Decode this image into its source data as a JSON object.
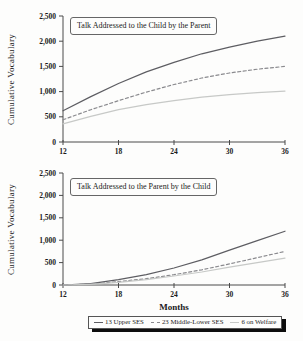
{
  "colors": {
    "background": "#fdfdfc",
    "axis": "#4a4a4a",
    "text": "#1b1b1b",
    "line_upper_ses": "#5d5d62",
    "line_middle_lower_ses": "#8a8a8e",
    "line_welfare": "#c7c9c7",
    "legend_shadow": "#0d0d0d"
  },
  "chart_data": [
    {
      "type": "line",
      "title": "Talk Addressed to the Child by the Parent",
      "ylabel": "Cumulative Vocabulary",
      "xlabel": "",
      "xlim": [
        12,
        36
      ],
      "ylim": [
        0,
        2500
      ],
      "grid": false,
      "x": [
        12,
        15,
        18,
        21,
        24,
        27,
        30,
        33,
        36
      ],
      "xticks": [
        {
          "value": 12,
          "label": "12"
        },
        {
          "value": 18,
          "label": "18"
        },
        {
          "value": 24,
          "label": "24"
        },
        {
          "value": 30,
          "label": "30"
        },
        {
          "value": 36,
          "label": "36"
        }
      ],
      "yticks": [
        {
          "value": 0,
          "label": "0"
        },
        {
          "value": 500,
          "label": "500"
        },
        {
          "value": 1000,
          "label": "1,000"
        },
        {
          "value": 1500,
          "label": "1,500"
        },
        {
          "value": 2000,
          "label": "2,000"
        },
        {
          "value": 2500,
          "label": "2,500"
        }
      ],
      "series": [
        {
          "name": "13 Upper SES",
          "style": "solid",
          "color": "#5d5d62",
          "values": [
            620,
            900,
            1160,
            1390,
            1580,
            1750,
            1880,
            2000,
            2100
          ]
        },
        {
          "name": "23 Middle-Lower SES",
          "style": "dashed",
          "color": "#8a8a8e",
          "values": [
            440,
            640,
            820,
            990,
            1140,
            1270,
            1370,
            1445,
            1500
          ]
        },
        {
          "name": "6 on Welfare",
          "style": "solid",
          "color": "#c7c9c7",
          "values": [
            360,
            510,
            640,
            740,
            820,
            890,
            940,
            980,
            1010
          ]
        }
      ]
    },
    {
      "type": "line",
      "title": "Talk Addressed to the Parent by the Child",
      "ylabel": "Cumulative Vocabulary",
      "xlabel": "Months",
      "xlim": [
        12,
        36
      ],
      "ylim": [
        0,
        2500
      ],
      "grid": false,
      "x": [
        12,
        15,
        18,
        21,
        24,
        27,
        30,
        33,
        36
      ],
      "xticks": [
        {
          "value": 12,
          "label": "12"
        },
        {
          "value": 18,
          "label": "18"
        },
        {
          "value": 24,
          "label": "24"
        },
        {
          "value": 30,
          "label": "30"
        },
        {
          "value": 36,
          "label": "36"
        }
      ],
      "yticks": [
        {
          "value": 0,
          "label": "0"
        },
        {
          "value": 500,
          "label": "500"
        },
        {
          "value": 1000,
          "label": "1,000"
        },
        {
          "value": 1500,
          "label": "1,500"
        },
        {
          "value": 2000,
          "label": "2,000"
        },
        {
          "value": 2500,
          "label": "2,500"
        }
      ],
      "series": [
        {
          "name": "13 Upper SES",
          "style": "solid",
          "color": "#5d5d62",
          "values": [
            0,
            30,
            120,
            230,
            380,
            560,
            780,
            990,
            1200
          ]
        },
        {
          "name": "23 Middle-Lower SES",
          "style": "dashed",
          "color": "#8a8a8e",
          "values": [
            0,
            20,
            75,
            140,
            230,
            340,
            470,
            610,
            750
          ]
        },
        {
          "name": "6 on Welfare",
          "style": "solid",
          "color": "#c7c9c7",
          "values": [
            0,
            15,
            60,
            120,
            200,
            290,
            400,
            500,
            600
          ]
        }
      ]
    }
  ],
  "legend": {
    "items": [
      {
        "label": "13 Upper SES",
        "style": "solid-dark",
        "color": "#5d5d62"
      },
      {
        "label": "23 Middle-Lower SES",
        "style": "dashed",
        "color": "#8a8a8e"
      },
      {
        "label": "6 on Welfare",
        "style": "solid-light",
        "color": "#c7c9c7"
      }
    ]
  }
}
